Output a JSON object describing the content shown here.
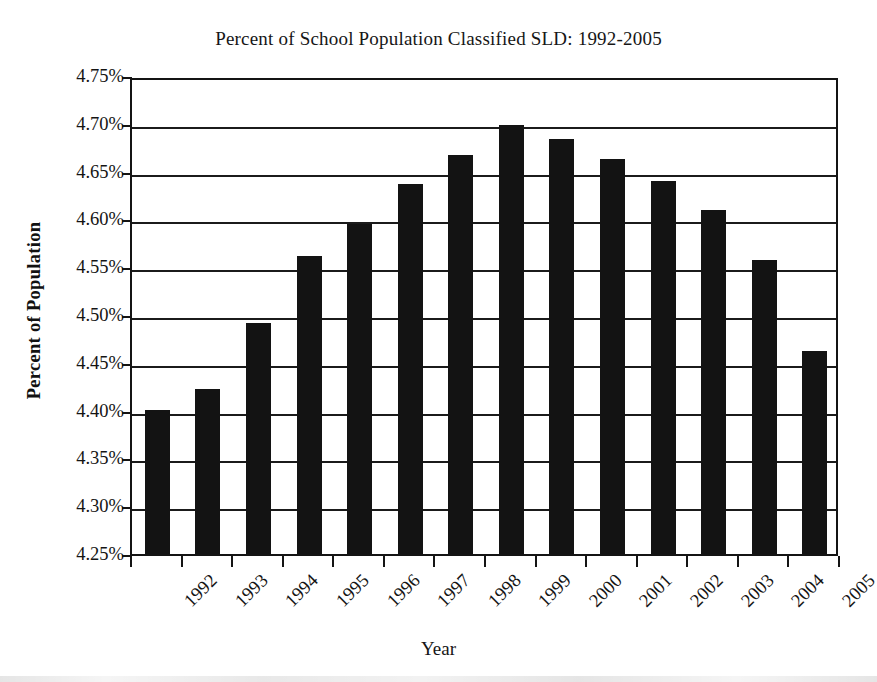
{
  "chart_data": {
    "type": "bar",
    "title": "Percent of School Population Classified SLD: 1992-2005",
    "xlabel": "Year",
    "ylabel": "Percent of Population",
    "categories": [
      "1992",
      "1993",
      "1994",
      "1995",
      "1996",
      "1997",
      "1998",
      "1999",
      "2000",
      "2001",
      "2002",
      "2003",
      "2004",
      "2005"
    ],
    "values": [
      4.401,
      4.423,
      4.492,
      4.562,
      4.595,
      4.637,
      4.667,
      4.699,
      4.684,
      4.663,
      4.64,
      4.61,
      4.558,
      4.462
    ],
    "ylim": [
      4.25,
      4.75
    ],
    "ytick_step": 0.05,
    "ytick_labels": [
      "4.75%",
      "4.70%",
      "4.65%",
      "4.60%",
      "4.55%",
      "4.50%",
      "4.45%",
      "4.40%",
      "4.35%",
      "4.30%",
      "4.25%"
    ],
    "ytick_values": [
      4.75,
      4.7,
      4.65,
      4.6,
      4.55,
      4.5,
      4.45,
      4.4,
      4.35,
      4.3,
      4.25
    ],
    "grid": true,
    "legend": null,
    "bar_color": "#131313",
    "axis_color": "#141414",
    "background_color": "#ffffff",
    "value_labels_shown": false,
    "series": [
      {
        "name": "Percent of School Population Classified SLD",
        "values": [
          4.401,
          4.423,
          4.492,
          4.562,
          4.595,
          4.637,
          4.667,
          4.699,
          4.684,
          4.663,
          4.64,
          4.61,
          4.558,
          4.462
        ]
      }
    ]
  }
}
